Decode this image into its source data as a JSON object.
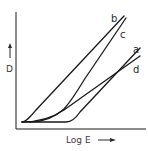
{
  "diagram": {
    "y_axis_label": "D",
    "x_axis_label": "Log E",
    "y_axis_arrow": "up-arrow",
    "x_axis_arrow": "right-arrow",
    "curves": [
      {
        "id": "b",
        "label": "b"
      },
      {
        "id": "c",
        "label": "c"
      },
      {
        "id": "a",
        "label": "a"
      },
      {
        "id": "d",
        "label": "d"
      }
    ],
    "line_color": "#1a1a1a"
  }
}
